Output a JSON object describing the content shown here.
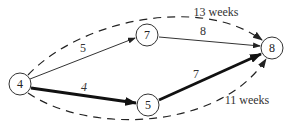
{
  "diagram": {
    "type": "activity-network",
    "nodes": [
      {
        "id": "4",
        "label": "4",
        "x": 20,
        "y": 84
      },
      {
        "id": "7",
        "label": "7",
        "x": 147,
        "y": 35
      },
      {
        "id": "5",
        "label": "5",
        "x": 148,
        "y": 105
      },
      {
        "id": "8",
        "label": "8",
        "x": 272,
        "y": 48
      }
    ],
    "edges": [
      {
        "from": "4",
        "to": "7",
        "label": "5",
        "style": "thin"
      },
      {
        "from": "7",
        "to": "8",
        "label": "8",
        "style": "thin"
      },
      {
        "from": "4",
        "to": "5",
        "label": "4",
        "style": "thick"
      },
      {
        "from": "5",
        "to": "8",
        "label": "7",
        "style": "thick"
      }
    ],
    "path_totals": [
      {
        "path": "4-7-8",
        "label": "13 weeks",
        "style": "dashed"
      },
      {
        "path": "4-5-8",
        "label": "11 weeks",
        "style": "dashed"
      }
    ]
  }
}
